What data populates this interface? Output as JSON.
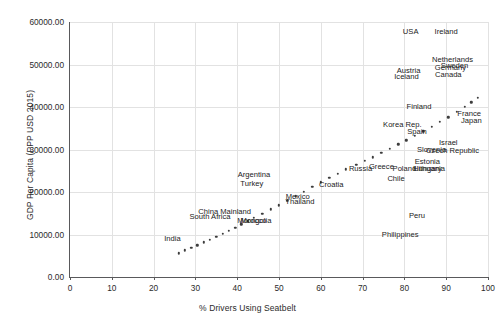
{
  "chart_data": {
    "type": "scatter",
    "title": "",
    "xlabel": "% Drivers Using Seatbelt",
    "ylabel": "GDP Per Capita (PPP USD 2015)",
    "xlim": [
      0,
      100
    ],
    "ylim": [
      0,
      60000
    ],
    "xticks": [
      "0",
      "10",
      "20",
      "30",
      "40",
      "50",
      "60",
      "70",
      "80",
      "90",
      "100"
    ],
    "yticks": [
      "0.00",
      "10000.00",
      "20000.00",
      "30000.00",
      "40000.00",
      "50000.00",
      "60000.00"
    ],
    "grid": true,
    "legend": "none",
    "marker_color": "#3d3d3d",
    "grid_color": "#e2e2e2",
    "axis_color": "#59595b",
    "points": [
      {
        "x": 26.0,
        "y": 5600,
        "label": "India",
        "lx": 24.5,
        "ly": 9200,
        "anchor": "right"
      },
      {
        "x": 27.5,
        "y": 6300,
        "label": "",
        "lx": 0,
        "ly": 0
      },
      {
        "x": 29.0,
        "y": 6900,
        "label": "",
        "lx": 0,
        "ly": 0
      },
      {
        "x": 30.5,
        "y": 7500,
        "label": "",
        "lx": 0,
        "ly": 0
      },
      {
        "x": 32.0,
        "y": 8200,
        "label": "South Africa",
        "lx": 33.5,
        "ly": 14300,
        "anchor": "center"
      },
      {
        "x": 33.5,
        "y": 8800,
        "label": "China Mainland",
        "lx": 37.0,
        "ly": 15500,
        "anchor": "center"
      },
      {
        "x": 35.0,
        "y": 9500,
        "label": "",
        "lx": 0,
        "ly": 0
      },
      {
        "x": 36.5,
        "y": 10200,
        "label": "",
        "lx": 0,
        "ly": 0
      },
      {
        "x": 38.0,
        "y": 10900,
        "label": "Mongolia",
        "lx": 44.5,
        "ly": 13300,
        "anchor": "center"
      },
      {
        "x": 39.5,
        "y": 11600,
        "label": "Morocco",
        "lx": 43.5,
        "ly": 13300,
        "anchor": "center"
      },
      {
        "x": 41.0,
        "y": 12400,
        "label": "",
        "lx": 0,
        "ly": 0
      },
      {
        "x": 42.5,
        "y": 13100,
        "label": "Turkey",
        "lx": 43.5,
        "ly": 22100,
        "anchor": "center"
      },
      {
        "x": 44.0,
        "y": 13900,
        "label": "Argentina",
        "lx": 44.0,
        "ly": 24300,
        "anchor": "center"
      },
      {
        "x": 46.0,
        "y": 14900,
        "label": "",
        "lx": 0,
        "ly": 0
      },
      {
        "x": 48.0,
        "y": 15900,
        "label": "Thailand",
        "lx": 55.0,
        "ly": 18000,
        "anchor": "center"
      },
      {
        "x": 50.0,
        "y": 16900,
        "label": "Mexico",
        "lx": 54.5,
        "ly": 19100,
        "anchor": "center"
      },
      {
        "x": 52.0,
        "y": 17900,
        "label": "",
        "lx": 0,
        "ly": 0
      },
      {
        "x": 54.0,
        "y": 19000,
        "label": "",
        "lx": 0,
        "ly": 0
      },
      {
        "x": 56.0,
        "y": 20100,
        "label": "",
        "lx": 0,
        "ly": 0
      },
      {
        "x": 58.0,
        "y": 21200,
        "label": "Croatia",
        "lx": 62.5,
        "ly": 21800,
        "anchor": "center"
      },
      {
        "x": 60.0,
        "y": 22300,
        "label": "",
        "lx": 0,
        "ly": 0
      },
      {
        "x": 62.0,
        "y": 23300,
        "label": "",
        "lx": 0,
        "ly": 0
      },
      {
        "x": 64.0,
        "y": 24300,
        "label": "Russia",
        "lx": 69.5,
        "ly": 25600,
        "anchor": "center"
      },
      {
        "x": 66.0,
        "y": 25300,
        "label": "Greece",
        "lx": 74.5,
        "ly": 26100,
        "anchor": "center"
      },
      {
        "x": 68.5,
        "y": 26400,
        "label": "Poland",
        "lx": 80.0,
        "ly": 25600,
        "anchor": "center"
      },
      {
        "x": 70.5,
        "y": 27300,
        "label": "Chile",
        "lx": 78.0,
        "ly": 23200,
        "anchor": "center"
      },
      {
        "x": 72.5,
        "y": 28200,
        "label": "Hungary",
        "lx": 85.5,
        "ly": 25600,
        "anchor": "center"
      },
      {
        "x": 74.5,
        "y": 29200,
        "label": "Lithuania",
        "lx": 86.0,
        "ly": 25600,
        "anchor": "center"
      },
      {
        "x": 76.5,
        "y": 30200,
        "label": "Estonia",
        "lx": 85.5,
        "ly": 27400,
        "anchor": "center"
      },
      {
        "x": 78.5,
        "y": 31200,
        "label": "Slovenia",
        "lx": 86.5,
        "ly": 30100,
        "anchor": "center"
      },
      {
        "x": 80.5,
        "y": 32200,
        "label": "Czech Republic",
        "lx": 91.5,
        "ly": 30000,
        "anchor": "center"
      },
      {
        "x": 82.5,
        "y": 33200,
        "label": "Spain",
        "lx": 83.0,
        "ly": 34400,
        "anchor": "center"
      },
      {
        "x": 84.5,
        "y": 34300,
        "label": "Israel",
        "lx": 90.5,
        "ly": 31800,
        "anchor": "center"
      },
      {
        "x": 86.5,
        "y": 35400,
        "label": "Korea Rep.",
        "lx": 79.5,
        "ly": 35900,
        "anchor": "center"
      },
      {
        "x": 88.5,
        "y": 36500,
        "label": "",
        "lx": 0,
        "ly": 0
      },
      {
        "x": 90.5,
        "y": 37600,
        "label": "Japan",
        "lx": 96.0,
        "ly": 36900,
        "anchor": "center"
      },
      {
        "x": 92.5,
        "y": 38800,
        "label": "France",
        "lx": 95.5,
        "ly": 38500,
        "anchor": "center"
      },
      {
        "x": 94.5,
        "y": 40000,
        "label": "Finland",
        "lx": 83.5,
        "ly": 40200,
        "anchor": "center"
      },
      {
        "x": 96.0,
        "y": 41100,
        "label": "",
        "lx": 0,
        "ly": 0
      },
      {
        "x": 97.5,
        "y": 42200,
        "label": "",
        "lx": 0,
        "ly": 0
      }
    ],
    "floating_labels": [
      {
        "label": "USA",
        "lx": 81.5,
        "ly": 57800
      },
      {
        "label": "Ireland",
        "lx": 90.0,
        "ly": 57800
      },
      {
        "label": "Netherlands",
        "lx": 91.5,
        "ly": 51400
      },
      {
        "label": "Sweden",
        "lx": 92.0,
        "ly": 50000
      },
      {
        "label": "Germany",
        "lx": 91.0,
        "ly": 49400
      },
      {
        "label": "Austria",
        "lx": 81.0,
        "ly": 48700
      },
      {
        "label": "Canada",
        "lx": 90.5,
        "ly": 47700
      },
      {
        "label": "Iceland",
        "lx": 80.5,
        "ly": 47200
      },
      {
        "label": "Peru",
        "lx": 83.0,
        "ly": 14500
      },
      {
        "label": "Philippines",
        "lx": 79.0,
        "ly": 10100
      }
    ]
  }
}
